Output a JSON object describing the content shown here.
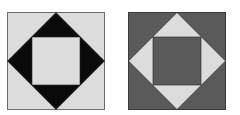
{
  "figures": [
    {
      "name": "left-tile",
      "background": "#dcdcdc",
      "diamond": "#0a0a0a",
      "center": "#dcdcdc",
      "border": "#6e6e6e"
    },
    {
      "name": "right-tile",
      "background": "#5a5a5a",
      "diamond": "#dcdcdc",
      "center": "#5a5a5a",
      "border": "#3a3a3a"
    }
  ]
}
